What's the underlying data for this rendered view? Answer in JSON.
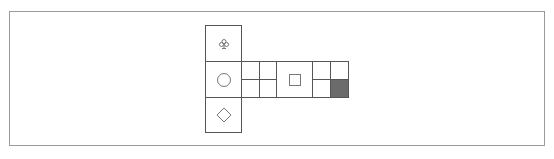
{
  "puzzle": {
    "frame": {
      "left": 9,
      "top": 11,
      "width": 536,
      "height": 135
    },
    "cells": [
      {
        "id": "top-left",
        "x": 205,
        "y": 25,
        "w": 37,
        "h": 37,
        "symbol": "club",
        "filled": false
      },
      {
        "id": "mid-left",
        "x": 205,
        "y": 61,
        "w": 37,
        "h": 37,
        "symbol": "circle",
        "filled": false
      },
      {
        "id": "bottom-left",
        "x": 205,
        "y": 97,
        "w": 37,
        "h": 36,
        "symbol": "diamond",
        "filled": false
      },
      {
        "id": "r1c1",
        "x": 241,
        "y": 61,
        "w": 19,
        "h": 19,
        "symbol": "",
        "filled": false
      },
      {
        "id": "r1c2",
        "x": 259,
        "y": 61,
        "w": 18,
        "h": 19,
        "symbol": "",
        "filled": false
      },
      {
        "id": "r2c1",
        "x": 241,
        "y": 79,
        "w": 19,
        "h": 19,
        "symbol": "",
        "filled": false
      },
      {
        "id": "r2c2",
        "x": 259,
        "y": 79,
        "w": 18,
        "h": 19,
        "symbol": "",
        "filled": false
      },
      {
        "id": "center",
        "x": 276,
        "y": 61,
        "w": 37,
        "h": 37,
        "symbol": "square",
        "filled": false
      },
      {
        "id": "r1c3",
        "x": 312,
        "y": 61,
        "w": 19,
        "h": 19,
        "symbol": "",
        "filled": false
      },
      {
        "id": "r1c4",
        "x": 330,
        "y": 61,
        "w": 19,
        "h": 19,
        "symbol": "",
        "filled": false
      },
      {
        "id": "r2c3",
        "x": 312,
        "y": 79,
        "w": 19,
        "h": 19,
        "symbol": "",
        "filled": false
      },
      {
        "id": "r2c4",
        "x": 330,
        "y": 79,
        "w": 19,
        "h": 19,
        "symbol": "",
        "filled": true
      }
    ],
    "colors": {
      "line": "#555555",
      "frame": "#9a9a9a",
      "fill": "#6b6b6b",
      "icon": "#777777"
    }
  }
}
